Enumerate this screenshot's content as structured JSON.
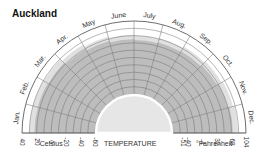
{
  "title": "Auckland",
  "colors": {
    "dark_band": "#bdbdbd",
    "light_band": "#e0e0e0",
    "inner_fill": "#e6e6e6",
    "grid": "#6e6e6e",
    "outline": "#555555",
    "background": "#ffffff"
  },
  "labels": {
    "celsius": "°Celsius",
    "temperature": "TEMPERATURE",
    "fahrenheit": "°Fahrenheit"
  },
  "chart_data": {
    "type": "radial-area",
    "title": "Auckland",
    "xlabel": "TEMPERATURE",
    "categories": [
      "Jan.",
      "Feb.",
      "Mar.",
      "Apr.",
      "May",
      "June",
      "July",
      "Aug.",
      "Sep.",
      "Oct.",
      "Nov.",
      "Dec."
    ],
    "celsius_ticks": [
      40,
      20,
      0,
      -20,
      -40,
      -60
    ],
    "fahrenheit_ticks": [
      -51,
      -40,
      -4,
      32,
      68,
      104
    ],
    "radial_range_celsius": [
      -60,
      40
    ],
    "series": [
      {
        "name": "Typical max temperature (°C)",
        "values": [
          23,
          23,
          22,
          19,
          17,
          15,
          14,
          15,
          16,
          18,
          20,
          22
        ]
      },
      {
        "name": "Record max temperature (°C)",
        "values": [
          30,
          30,
          29,
          26,
          23,
          21,
          20,
          21,
          23,
          25,
          27,
          29
        ]
      }
    ],
    "grid": true
  }
}
